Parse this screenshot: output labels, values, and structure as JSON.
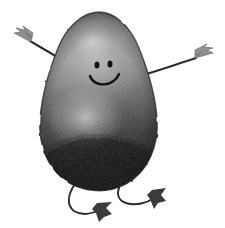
{
  "scene": {
    "title": "Cartoon pear-shaped character",
    "description": "Grainy grayscale pear or avocado shaped character with a smiley face, two thin outstretched arms with arrow-like hands, and two curved legs with dark arrow-shaped feet.",
    "background_color": "#ffffff",
    "canvas": {
      "width": 225,
      "height": 228
    }
  },
  "colors": {
    "background": "#ffffff",
    "body_top": "#8e8e8e",
    "body_highlight": "#c9c9c9",
    "body_mid": "#6b6b6b",
    "body_bottom": "#1d1d1d",
    "body_outline": "#2b2b2b",
    "face_ink": "#141414",
    "limb_ink": "#2e2e2e",
    "hand_gray": "#9a9a9a",
    "foot_dark": "#3a3a3a"
  },
  "body": {
    "name": "pear-body",
    "shape": "pear",
    "top_center_x": 99,
    "top_y": 12,
    "widest_y": 140,
    "left_edge_x": 39,
    "right_edge_x": 156,
    "bottom_y": 192,
    "texture": "grainy-stipple",
    "shading": "light top-left highlight fading to near-black bottom"
  },
  "face": {
    "name": "smiley-face",
    "eye_left": {
      "cx": 97,
      "cy": 65,
      "rx": 2.4,
      "ry": 3.4
    },
    "eye_right": {
      "cx": 110,
      "cy": 64,
      "rx": 2.4,
      "ry": 3.4
    },
    "mouth": {
      "type": "smile-arc",
      "start_x": 90,
      "end_x": 120,
      "depth_y": 84
    }
  },
  "arms": [
    {
      "name": "left-arm",
      "side": "left",
      "shoulder": {
        "x": 73,
        "y": 67
      },
      "hand": {
        "x": 17,
        "y": 36
      },
      "hand_style": "arrow-fletch",
      "direction": "up-left"
    },
    {
      "name": "right-arm",
      "side": "right",
      "shoulder": {
        "x": 146,
        "y": 73
      },
      "hand": {
        "x": 208,
        "y": 56
      },
      "hand_style": "arrow-fletch",
      "direction": "up-right"
    }
  ],
  "legs": [
    {
      "name": "left-leg",
      "side": "left",
      "hip": {
        "x": 74,
        "y": 186
      },
      "foot": {
        "x": 104,
        "y": 211
      },
      "foot_style": "arrow-boot",
      "curve": "swoop-left-then-right"
    },
    {
      "name": "right-leg",
      "side": "right",
      "hip": {
        "x": 120,
        "y": 186
      },
      "foot": {
        "x": 160,
        "y": 198
      },
      "foot_style": "arrow-boot",
      "curve": "swoop-left-then-right"
    }
  ]
}
